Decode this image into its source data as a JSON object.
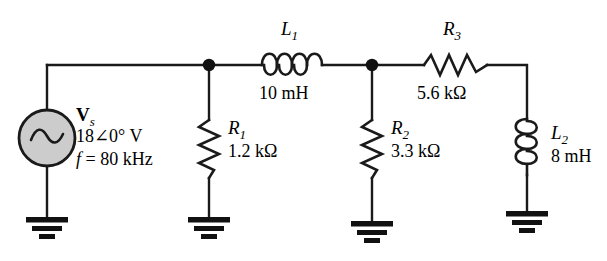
{
  "diagram": {
    "background_color": "#ffffff",
    "wire_color": "#1a1a1a",
    "source_fill_color": "#cccccc"
  },
  "source": {
    "name_main": "V",
    "name_sub": "s",
    "value": "18∠0° V",
    "frequency_var": "f",
    "frequency_rest": " = 80 kHz",
    "symbol": "ac-source-sine"
  },
  "components": {
    "l1": {
      "symbol_main": "L",
      "symbol_sub": "1",
      "value": "10 mH",
      "kind": "inductor-horizontal"
    },
    "r1": {
      "symbol_main": "R",
      "symbol_sub": "1",
      "value": "1.2 kΩ",
      "kind": "resistor-vertical"
    },
    "r2": {
      "symbol_main": "R",
      "symbol_sub": "2",
      "value": "3.3 kΩ",
      "kind": "resistor-vertical"
    },
    "r3": {
      "symbol_main": "R",
      "symbol_sub": "3",
      "value": "5.6 kΩ",
      "kind": "resistor-horizontal"
    },
    "l2": {
      "symbol_main": "L",
      "symbol_sub": "2",
      "value": "8 mH",
      "kind": "inductor-vertical"
    }
  },
  "nodes": {
    "junction_left": "junction-dot",
    "junction_right": "junction-dot"
  },
  "grounds": [
    "ground-source",
    "ground-r1",
    "ground-r2",
    "ground-l2"
  ]
}
